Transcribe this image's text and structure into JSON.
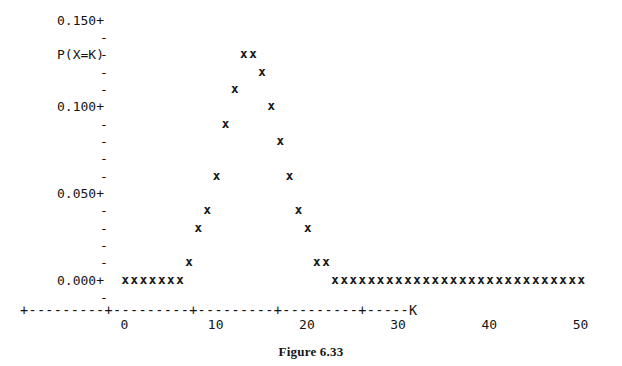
{
  "figure": {
    "caption": "Figure 6.33",
    "axis_label_y": "P(X=K)",
    "axis_label_x": "K"
  },
  "y_axis": {
    "tick_labels": [
      "0.150+",
      "0.100+",
      "0.050+",
      "0.000+"
    ],
    "minor_tick_glyph": "-",
    "major_tick_glyph": "+"
  },
  "x_axis": {
    "line": "+---------+---------+---------+---------+-----K",
    "tick_labels": [
      "0",
      "10",
      "20",
      "30",
      "40",
      "50"
    ]
  },
  "marker": "x",
  "chart_data": {
    "type": "scatter",
    "title": "Figure 6.33",
    "xlabel": "K",
    "ylabel": "P(X=K)",
    "xlim": [
      -11,
      50
    ],
    "ylim": [
      0.0,
      0.155
    ],
    "xticks": [
      0,
      10,
      20,
      30,
      40,
      50
    ],
    "yticks": [
      0.0,
      0.05,
      0.1,
      0.15
    ],
    "ytick_labels": [
      "0.000+",
      "0.050+",
      "0.100+",
      "0.150+"
    ],
    "grid": false,
    "legend": null,
    "row_step": 0.01,
    "series": [
      {
        "name": "P(X=K)",
        "marker": "x",
        "x": [
          0,
          1,
          2,
          3,
          4,
          5,
          6,
          7,
          8,
          9,
          10,
          11,
          12,
          13,
          14,
          15,
          16,
          17,
          18,
          19,
          20,
          21,
          22,
          23,
          24,
          25,
          26,
          27,
          28,
          29,
          30,
          31,
          32,
          33,
          34,
          35,
          36,
          37,
          38,
          39,
          40,
          41,
          42,
          43,
          44,
          45,
          46,
          47,
          48,
          49,
          50
        ],
        "y": [
          0.0,
          0.0,
          0.0,
          0.0,
          0.0,
          0.0,
          0.0,
          0.01,
          0.03,
          0.04,
          0.06,
          0.09,
          0.11,
          0.13,
          0.13,
          0.12,
          0.1,
          0.08,
          0.06,
          0.04,
          0.03,
          0.01,
          0.01,
          0.0,
          0.0,
          0.0,
          0.0,
          0.0,
          0.0,
          0.0,
          0.0,
          0.0,
          0.0,
          0.0,
          0.0,
          0.0,
          0.0,
          0.0,
          0.0,
          0.0,
          0.0,
          0.0,
          0.0,
          0.0,
          0.0,
          0.0,
          0.0,
          0.0,
          0.0,
          0.0,
          0.0
        ]
      }
    ]
  }
}
